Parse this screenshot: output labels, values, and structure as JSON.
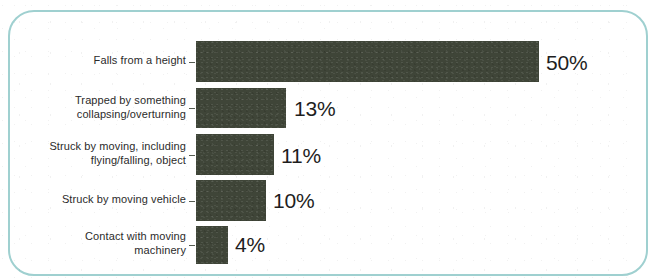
{
  "chart_data": {
    "type": "bar",
    "orientation": "horizontal",
    "title": "",
    "subtitle": "",
    "xlabel": "",
    "ylabel": "",
    "categories": [
      "Falls from a height",
      "Trapped by something\ncollapsing/overturning",
      "Struck by moving, including\nflying/falling, object",
      "Struck by moving vehicle",
      "Contact with moving\nmachinery"
    ],
    "values": [
      50,
      13,
      11,
      10,
      4
    ],
    "value_labels": [
      "50%",
      "13%",
      "11%",
      "10%",
      "4%"
    ],
    "xlim": [
      0,
      50
    ],
    "grid": false,
    "legend": "none",
    "bar_color": "#3f4538",
    "frame_color": "#9fd0d0",
    "background_color": "#ffffff",
    "value_label_color": "#1e1e1e",
    "category_label_color": "#2b2b2b"
  },
  "rows": [
    {
      "category": "Falls from a height",
      "value": 50,
      "value_label": "50%",
      "bar_top": 41,
      "bar_height": 41,
      "bar_width": 343,
      "label_top": 54,
      "value_left": 546,
      "value_top": 52
    },
    {
      "category": "Trapped by something\ncollapsing/overturning",
      "value": 13,
      "value_label": "13%",
      "bar_top": 88,
      "bar_height": 40,
      "bar_width": 90,
      "label_top": 94,
      "value_left": 294,
      "value_top": 98
    },
    {
      "category": "Struck by moving, including\nflying/falling, object",
      "value": 11,
      "value_label": "11%",
      "bar_top": 134,
      "bar_height": 41,
      "bar_width": 78,
      "label_top": 140,
      "value_left": 281,
      "value_top": 145
    },
    {
      "category": "Struck by moving vehicle",
      "value": 10,
      "value_label": "10%",
      "bar_top": 180,
      "bar_height": 41,
      "bar_width": 70,
      "label_top": 193,
      "value_left": 273,
      "value_top": 190
    },
    {
      "category": "Contact with moving\nmachinery",
      "value": 4,
      "value_label": "4%",
      "bar_top": 226,
      "bar_height": 38,
      "bar_width": 32,
      "label_top": 230,
      "value_left": 235,
      "value_top": 234
    }
  ]
}
